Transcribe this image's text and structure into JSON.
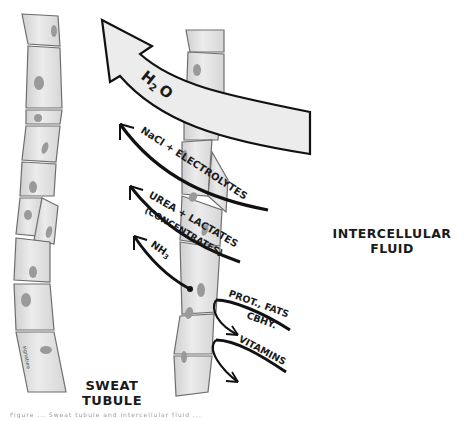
{
  "figure": {
    "title_regions": {
      "left_structure": "SWEAT",
      "left_structure_line2": "TUBULE",
      "right_region": "INTERCELLULAR",
      "right_region_line2": "FLUID"
    },
    "arrows_into_tubule": [
      {
        "label": "H2O",
        "label_main": "H",
        "label_sub": "2",
        "label_tail": "O",
        "style": "large hollow arrow"
      },
      {
        "label": "NaCl + ELECTROLYTES",
        "style": "thin curved arrow"
      },
      {
        "label": "UREA + LACTATES",
        "sublabel": "(CONCENTRATES)",
        "style": "thin curved arrow"
      },
      {
        "label": "NH3",
        "label_main": "NH",
        "label_sub": "3",
        "style": "thin curved arrow"
      }
    ],
    "arrows_out_of_tubule": [
      {
        "label": "PROT., FATS",
        "sublabel": "CBHY.",
        "style": "thin curved arrow"
      },
      {
        "label": "VITAMINS",
        "style": "thin curved arrow"
      }
    ],
    "artist_signature": "signature",
    "caption": "Figure ... Sweat tubule and intercellular fluid ..."
  },
  "colors": {
    "background": "#ffffff",
    "cell_fill": "#e4e4e4",
    "cell_outline": "#6e6e6e",
    "nucleus": "#9a9a9a",
    "ink": "#111111",
    "h2o_arrow_fill": "#ececec"
  }
}
